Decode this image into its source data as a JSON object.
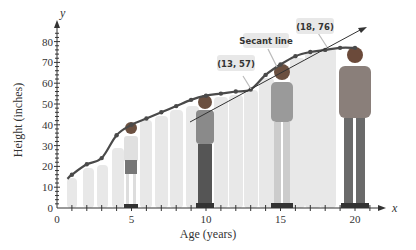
{
  "chart_data": {
    "type": "line",
    "title": "",
    "xlabel": "Age (years)",
    "ylabel": "Height (inches)",
    "x_axis_var": "x",
    "y_axis_var": "y",
    "xlim": [
      0,
      21
    ],
    "ylim": [
      0,
      85
    ],
    "x_ticks": [
      0,
      5,
      10,
      15,
      20
    ],
    "y_ticks": [
      0,
      10,
      20,
      30,
      40,
      50,
      60,
      70,
      80
    ],
    "grid": false,
    "series": [
      {
        "name": "Height growth curve",
        "x": [
          0.7,
          1,
          2,
          3,
          4,
          5,
          6,
          7,
          8,
          9,
          10,
          11,
          12,
          13,
          14,
          15,
          16,
          17,
          18,
          19,
          20
        ],
        "values": [
          14,
          16,
          21,
          24,
          35,
          40,
          43,
          46,
          49,
          52,
          54,
          55,
          56,
          57,
          64,
          69,
          73,
          75,
          76,
          77,
          77
        ]
      },
      {
        "name": "Secant line",
        "x": [
          9,
          21
        ],
        "values": [
          41,
          87
        ]
      }
    ],
    "annotations": [
      {
        "label": "(13, 57)",
        "x": 13,
        "y": 57
      },
      {
        "label": "(18, 76)",
        "x": 18,
        "y": 76
      },
      {
        "label": "Secant line",
        "target": "secant"
      }
    ]
  },
  "labels": {
    "x_var": "x",
    "y_var": "y",
    "xlabel": "Age (years)",
    "ylabel": "Height (inches)",
    "callout_13": "(13, 57)",
    "callout_18": "(18, 76)",
    "callout_secant": "Secant line",
    "x_ticks": [
      "0",
      "5",
      "10",
      "15",
      "20"
    ],
    "y_ticks": [
      "0",
      "10",
      "20",
      "30",
      "40",
      "50",
      "60",
      "70",
      "80"
    ]
  },
  "colors": {
    "curve": "#4a4a4a",
    "silhouette": "#e6e6e6",
    "callout_bg": "#e8e8e8",
    "axis": "#333333"
  }
}
